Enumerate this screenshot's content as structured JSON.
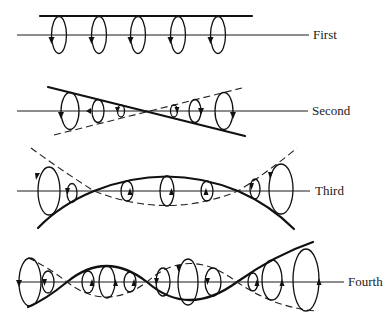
{
  "figure": {
    "rows": [
      {
        "id": "first",
        "label": "First",
        "axis_y": 35
      },
      {
        "id": "second",
        "label": "Second",
        "axis_y": 111
      },
      {
        "id": "third",
        "label": "Third",
        "axis_y": 191
      },
      {
        "id": "fourth",
        "label": "Fourth",
        "axis_y": 282
      }
    ],
    "legend": {
      "solid_line": "thick envelope",
      "dashed_line": "dashed envelope",
      "loop_arrow": "direction of circulation"
    }
  },
  "colors": {
    "ink": "#111111",
    "background": "#ffffff"
  }
}
